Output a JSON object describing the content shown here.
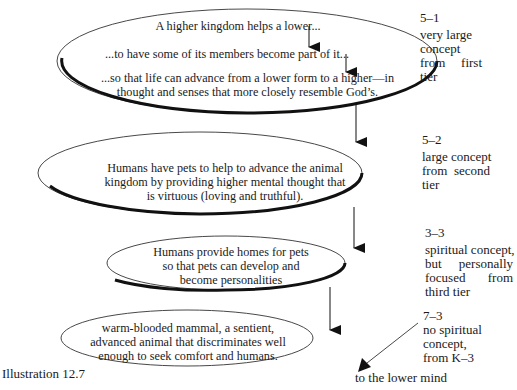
{
  "diagram": {
    "caption": "Illustration 12.7",
    "bottom_label": "to the lower mind",
    "ellipses": [
      {
        "lines": [
          "A higher kingdom helps a lower...",
          "...to have some of its members become part of it...",
          "...so that life can advance from a lower form to a higher—in",
          "thought and senses that more closely resemble God’s."
        ]
      },
      {
        "lines": [
          "Humans have pets to help to advance the animal",
          "kingdom by providing higher mental thought that",
          "is virtuous (loving and truthful)."
        ]
      },
      {
        "lines": [
          "Humans provide homes for pets",
          "so that pets can develop and",
          "become personalities"
        ]
      },
      {
        "lines": [
          "warm-blooded mammal, a sentient,",
          "advanced animal that discriminates well",
          "enough to seek comfort and humans."
        ]
      }
    ],
    "side_notes": [
      {
        "code": "5–1",
        "lines": [
          "very large",
          "concept",
          "from first",
          "tier"
        ]
      },
      {
        "code": "5–2",
        "lines": [
          "large concept",
          "from second",
          "tier"
        ]
      },
      {
        "code": "3–3",
        "lines": [
          "spiritual concept,",
          "but personally",
          "focused from",
          "third tier"
        ]
      },
      {
        "code": "7–3",
        "lines": [
          "no spiritual",
          "concept,",
          "from K–3"
        ]
      }
    ]
  }
}
